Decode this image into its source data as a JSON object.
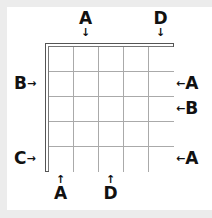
{
  "puzzle": {
    "rows": 5,
    "cols": 5,
    "colors": {
      "frame": "#ececec",
      "panel": "#ffffff",
      "grid_line": "#aaaaaa",
      "border": "#555555",
      "text": "#111111"
    },
    "clues": {
      "top": [
        {
          "col": 2,
          "letter": "A",
          "arrow": "↓"
        },
        {
          "col": 5,
          "letter": "D",
          "arrow": "↓"
        }
      ],
      "bottom": [
        {
          "col": 1,
          "letter": "A",
          "arrow": "↑"
        },
        {
          "col": 3,
          "letter": "D",
          "arrow": "↑"
        }
      ],
      "left": [
        {
          "row": 2,
          "letter": "B",
          "arrow": "→"
        },
        {
          "row": 5,
          "letter": "C",
          "arrow": "→"
        }
      ],
      "right": [
        {
          "row": 2,
          "letter": "A",
          "arrow": "←"
        },
        {
          "row": 3,
          "letter": "B",
          "arrow": "←"
        },
        {
          "row": 5,
          "letter": "A",
          "arrow": "←"
        }
      ]
    }
  }
}
